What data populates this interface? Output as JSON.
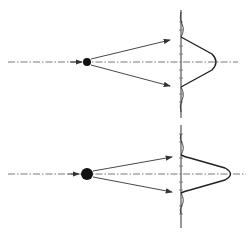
{
  "diagram": {
    "colors": {
      "line": "#333333",
      "background": "#ffffff",
      "particle": "#111111"
    },
    "panels": [
      {
        "id": "small-particle",
        "axis_y": 62,
        "particle": {
          "cx": 87,
          "cy": 62,
          "r": 4
        },
        "arrow_up_end": [
          170,
          40
        ],
        "arrow_down_end": [
          170,
          86
        ],
        "screen_x": 181,
        "screen_top": 10,
        "screen_bottom": 118,
        "main_lobe_half_width": 25,
        "peak_x": 218
      },
      {
        "id": "large-particle",
        "axis_y": 174,
        "particle": {
          "cx": 87,
          "cy": 174,
          "r": 6
        },
        "arrow_up_end": [
          172,
          156
        ],
        "arrow_down_end": [
          172,
          192
        ],
        "screen_x": 181,
        "screen_top": 125,
        "screen_bottom": 228,
        "main_lobe_half_width": 18,
        "peak_x": 232
      }
    ]
  }
}
